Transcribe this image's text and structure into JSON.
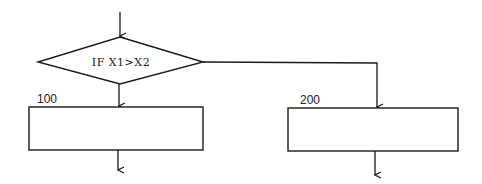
{
  "diagram": {
    "type": "flowchart",
    "decision": {
      "condition": "IF X1>X2"
    },
    "blocks": [
      {
        "label": "100",
        "branch": "true"
      },
      {
        "label": "200",
        "branch": "false"
      }
    ],
    "colors": {
      "line": "#1a1a1a",
      "background": "#ffffff"
    }
  }
}
